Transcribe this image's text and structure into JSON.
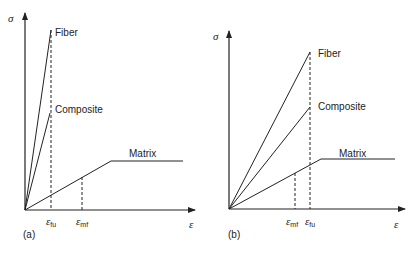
{
  "figure": {
    "panels": [
      {
        "id": "a",
        "label": "(a)",
        "y_axis_symbol": "σ",
        "x_axis_symbol": "ε",
        "curves": {
          "fiber": "Fiber",
          "composite": "Composite",
          "matrix": "Matrix"
        },
        "markers": [
          {
            "symbol": "ε",
            "sub": "fu"
          },
          {
            "symbol": "ε",
            "sub": "mf"
          }
        ]
      },
      {
        "id": "b",
        "label": "(b)",
        "y_axis_symbol": "σ",
        "x_axis_symbol": "ε",
        "curves": {
          "fiber": "Fiber",
          "composite": "Composite",
          "matrix": "Matrix"
        },
        "markers": [
          {
            "symbol": "ε",
            "sub": "mf"
          },
          {
            "symbol": "ε",
            "sub": "fu"
          }
        ]
      }
    ],
    "colors": {
      "line": "#222222",
      "background": "#ffffff"
    }
  }
}
